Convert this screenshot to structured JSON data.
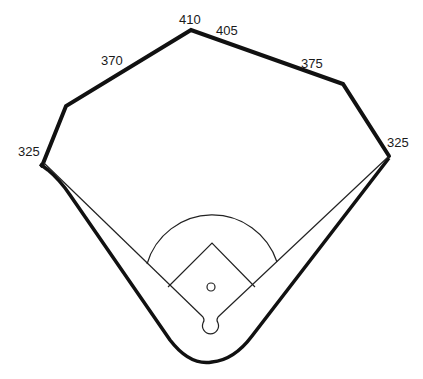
{
  "diagram": {
    "type": "baseball-field",
    "distances": {
      "left_field_line": "325",
      "left_center": "370",
      "center_left": "410",
      "center_right": "405",
      "right_center": "375",
      "right_field_line": "325"
    },
    "colors": {
      "background": "#ffffff",
      "fence": "#111111",
      "lines": "#222222"
    }
  }
}
